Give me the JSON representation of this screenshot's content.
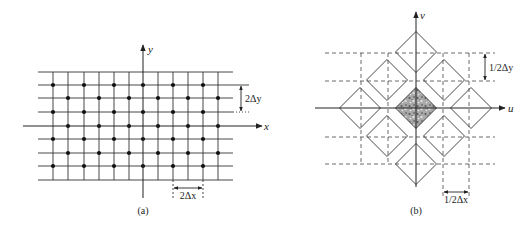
{
  "figure_a": {
    "caption": "(a)",
    "x_axis_label": "x",
    "y_axis_label": "y",
    "dim_y_label": "2Δy",
    "dim_x_label": "2Δx",
    "grid_rows_y": [
      72,
      85,
      98,
      112,
      139,
      153,
      166,
      180
    ],
    "x_axis_y": 126,
    "grid_cols_x": [
      53,
      68,
      84,
      99,
      114,
      129,
      158,
      173,
      188,
      203,
      218
    ],
    "y_axis_x": 143,
    "dot_rows_even_y": [
      85,
      112,
      139,
      166
    ],
    "dot_cols_even_x": [
      53,
      84,
      114,
      143,
      173,
      203
    ],
    "dot_rows_odd_y": [
      98,
      126,
      153
    ],
    "dot_cols_odd_x": [
      68,
      99,
      129,
      158,
      188,
      218
    ]
  },
  "figure_b": {
    "caption": "(b)",
    "u_axis_label": "u",
    "v_axis_label": "v",
    "dim_v_label": "1/2Δy",
    "dim_u_label": "1/2Δx",
    "diamond_half_size": 20.5,
    "diamond_centers": [
      [
        416,
        52
      ],
      [
        387,
        80
      ],
      [
        444,
        80
      ],
      [
        360,
        108
      ],
      [
        416,
        108
      ],
      [
        471,
        108
      ],
      [
        387,
        136
      ],
      [
        444,
        136
      ],
      [
        416,
        164
      ]
    ],
    "shaded_diamond_index": 4,
    "dashed_rows_y": [
      53,
      81,
      137,
      164
    ],
    "dashed_cols_x": [
      361,
      388,
      443,
      469
    ],
    "shade_color": "#9a9a9a"
  }
}
